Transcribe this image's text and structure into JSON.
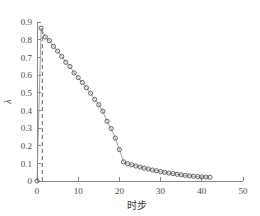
{
  "chart_data": {
    "type": "line",
    "title": "",
    "subtitle": "",
    "xlabel": "时步",
    "ylabel": "λ",
    "xlim": [
      0,
      50
    ],
    "ylim": [
      0,
      0.9
    ],
    "xticks": [
      0,
      10,
      20,
      30,
      40,
      50
    ],
    "xticklabels": [
      "0",
      "10",
      "20",
      "30",
      "40",
      "50"
    ],
    "yticks": [
      0,
      0.1,
      0.2,
      0.3,
      0.4,
      0.5,
      0.6,
      0.7,
      0.8,
      0.9
    ],
    "yticklabels": [
      "0",
      "0.1",
      "0.2",
      "0.3",
      "0.4",
      "0.5",
      "0.6",
      "0.7",
      "0.8",
      "0.9"
    ],
    "grid": false,
    "legend": null,
    "legend_position": "none",
    "marker": "open-circle",
    "marker_color": "#555555",
    "line_color": "#8c8c8c",
    "series": [
      {
        "name": "lambda",
        "x": [
          0,
          1,
          2,
          3,
          4,
          5,
          6,
          7,
          8,
          9,
          10,
          11,
          12,
          13,
          14,
          15,
          16,
          17,
          18,
          19,
          20,
          21,
          22,
          23,
          24,
          25,
          26,
          27,
          28,
          29,
          30,
          31,
          32,
          33,
          34,
          35,
          36,
          37,
          38,
          39,
          40,
          41,
          42
        ],
        "values": [
          0.0,
          0.865,
          0.815,
          0.795,
          0.762,
          0.735,
          0.705,
          0.672,
          0.648,
          0.612,
          0.585,
          0.558,
          0.528,
          0.497,
          0.462,
          0.432,
          0.395,
          0.338,
          0.297,
          0.243,
          0.178,
          0.108,
          0.098,
          0.092,
          0.085,
          0.079,
          0.073,
          0.068,
          0.062,
          0.058,
          0.053,
          0.049,
          0.045,
          0.042,
          0.038,
          0.035,
          0.032,
          0.029,
          0.027,
          0.025,
          0.023,
          0.022,
          0.021
        ]
      }
    ],
    "annotations": [
      {
        "name": "vertical-dashed-line",
        "type": "vline",
        "x": 1.3,
        "y_from": 0.0,
        "y_to": 0.87,
        "style": "dashed",
        "color": "#7a7a7a"
      }
    ],
    "spines": {
      "left": true,
      "bottom": true,
      "top": false,
      "right": false
    }
  }
}
